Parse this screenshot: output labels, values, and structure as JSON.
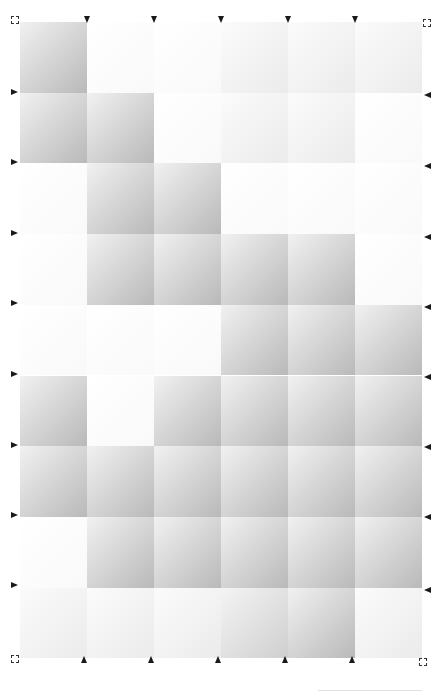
{
  "grid": {
    "columns": 6,
    "rows": 9,
    "origin": [
      20,
      22
    ],
    "cell_width": 67,
    "cell_height": 70.7,
    "shade_levels": {
      "0": "near-white",
      "1": "faint",
      "2": "medium",
      "3": "strong"
    },
    "shading": [
      [
        3,
        0,
        0,
        1,
        1,
        1
      ],
      [
        3,
        3,
        0,
        1,
        1,
        0
      ],
      [
        0,
        3,
        3,
        0,
        0,
        0
      ],
      [
        0,
        3,
        3,
        3,
        3,
        0
      ],
      [
        0,
        0,
        0,
        3,
        3,
        3
      ],
      [
        3,
        0,
        3,
        3,
        3,
        3
      ],
      [
        3,
        3,
        3,
        3,
        3,
        3
      ],
      [
        0,
        3,
        3,
        3,
        3,
        3
      ],
      [
        1,
        1,
        1,
        2,
        3,
        1
      ]
    ]
  },
  "markers": {
    "top": [
      87,
      154,
      221,
      288,
      355
    ],
    "bottom": [
      84,
      151,
      218,
      285,
      352
    ],
    "left": [
      92,
      162,
      233,
      303,
      374,
      445,
      515,
      585
    ],
    "right": [
      95,
      166,
      237,
      307,
      377,
      447,
      517,
      590
    ]
  },
  "corners": [
    {
      "name": "top-left",
      "x": 11,
      "y": 16
    },
    {
      "name": "top-right",
      "x": 423,
      "y": 19
    },
    {
      "name": "bottom-left",
      "x": 11,
      "y": 655
    },
    {
      "name": "bottom-right",
      "x": 419,
      "y": 658
    }
  ],
  "colors": {
    "marker": "#1a1a1a",
    "background": "#ffffff"
  }
}
